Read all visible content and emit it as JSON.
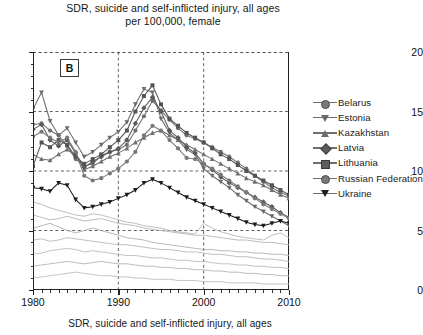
{
  "figure": {
    "title_line1": "SDR, suicide and self-inflicted injury, all ages",
    "title_line2": "per 100,000, female",
    "bottom_caption": "SDR, suicide and self-inflicted injury, all ages",
    "panel_label": "B"
  },
  "chart_data": {
    "type": "line",
    "title": "SDR, suicide and self-inflicted injury, all ages per 100,000, female",
    "xlabel": "",
    "ylabel": "",
    "xlim": [
      1980,
      2010
    ],
    "ylim": [
      0,
      20
    ],
    "yticks": [
      0,
      5,
      10,
      15,
      20
    ],
    "xticks": [
      1980,
      1990,
      2000,
      2010
    ],
    "xticks_minor_step": 1,
    "grid": true,
    "grid_style": "dashed",
    "legend_position": "right",
    "x": [
      1980,
      1981,
      1982,
      1983,
      1984,
      1985,
      1986,
      1987,
      1988,
      1989,
      1990,
      1991,
      1992,
      1993,
      1994,
      1995,
      1996,
      1997,
      1998,
      1999,
      2000,
      2001,
      2002,
      2003,
      2004,
      2005,
      2006,
      2007,
      2008,
      2009,
      2010
    ],
    "series": [
      {
        "name": "Belarus",
        "marker": "circle",
        "color": "#6f6f6f",
        "values": [
          13.9,
          14.0,
          13.4,
          13.0,
          12.1,
          11.0,
          10.4,
          10.6,
          11.3,
          11.6,
          11.8,
          12.2,
          13.4,
          14.6,
          15.9,
          15.1,
          14.3,
          13.6,
          13.0,
          12.7,
          12.4,
          12.0,
          11.6,
          11.2,
          10.7,
          10.2,
          9.6,
          9.1,
          8.6,
          8.2,
          7.9
        ]
      },
      {
        "name": "Estonia",
        "marker": "triangle-down",
        "color": "#6b6b6b",
        "values": [
          15.2,
          16.6,
          14.2,
          13.0,
          13.6,
          12.4,
          11.2,
          11.6,
          12.2,
          12.8,
          13.3,
          14.1,
          15.6,
          16.9,
          16.6,
          14.4,
          13.2,
          12.6,
          11.8,
          11.4,
          10.2,
          9.6,
          9.1,
          8.6,
          8.0,
          7.5,
          7.0,
          6.6,
          6.2,
          5.8,
          5.4
        ]
      },
      {
        "name": "Kazakhstan",
        "marker": "triangle-up",
        "color": "#707070",
        "values": [
          11.4,
          11.0,
          10.9,
          11.4,
          11.8,
          11.3,
          10.1,
          10.4,
          10.8,
          11.2,
          11.5,
          11.9,
          12.4,
          12.8,
          13.2,
          13.4,
          13.0,
          12.6,
          12.2,
          11.8,
          11.4,
          11.0,
          10.6,
          10.2,
          9.8,
          9.4,
          9.1,
          8.8,
          8.4,
          8.0,
          7.7
        ]
      },
      {
        "name": "Latvia",
        "marker": "diamond",
        "color": "#5a5a5a",
        "values": [
          13.5,
          13.9,
          12.6,
          12.1,
          12.6,
          11.5,
          10.3,
          10.8,
          11.2,
          11.6,
          11.9,
          12.6,
          14.0,
          15.3,
          16.2,
          15.0,
          13.4,
          12.8,
          12.0,
          11.5,
          10.6,
          10.1,
          9.5,
          9.0,
          8.6,
          8.2,
          7.8,
          7.4,
          7.0,
          6.5,
          6.1
        ]
      },
      {
        "name": "Lithuania",
        "marker": "square",
        "color": "#545454",
        "values": [
          10.4,
          12.4,
          12.0,
          12.6,
          12.2,
          11.2,
          10.6,
          11.0,
          11.4,
          12.0,
          12.6,
          13.4,
          15.0,
          16.3,
          17.2,
          15.6,
          14.4,
          13.8,
          13.2,
          12.8,
          12.4,
          11.9,
          11.4,
          11.0,
          10.5,
          10.0,
          9.6,
          9.2,
          8.8,
          8.4,
          8.0
        ]
      },
      {
        "name": "Russian Federation",
        "marker": "circle",
        "color": "#777777",
        "values": [
          12.9,
          13.3,
          12.8,
          12.4,
          12.8,
          11.6,
          9.6,
          9.2,
          9.4,
          9.8,
          10.2,
          10.8,
          11.6,
          13.0,
          13.8,
          13.4,
          12.6,
          11.9,
          11.1,
          11.0,
          10.6,
          10.2,
          9.7,
          9.2,
          8.7,
          8.2,
          7.7,
          7.2,
          6.8,
          6.4,
          6.0
        ]
      },
      {
        "name": "Ukraine",
        "marker": "triangle-down-filled",
        "color": "#1d1d1d",
        "values": [
          8.6,
          8.5,
          8.3,
          9.0,
          8.8,
          7.6,
          6.9,
          7.0,
          7.2,
          7.4,
          7.7,
          8.0,
          8.4,
          9.0,
          9.3,
          9.0,
          8.6,
          8.2,
          7.8,
          7.5,
          7.2,
          6.9,
          6.6,
          6.3,
          6.0,
          5.7,
          5.5,
          5.4,
          5.6,
          5.8,
          5.6
        ]
      }
    ],
    "background_series": [
      {
        "name": "reference-1",
        "color": "#b6b6b6",
        "values": [
          6.3,
          6.1,
          5.9,
          6.0,
          6.2,
          6.0,
          5.8,
          5.9,
          6.0,
          5.8,
          5.6,
          5.5,
          5.4,
          5.2,
          5.1,
          5.0,
          4.9,
          4.8,
          4.7,
          4.6,
          4.6,
          4.5,
          4.4,
          4.3,
          4.2,
          4.2,
          4.1,
          4.0,
          4.0,
          3.9,
          3.8
        ]
      },
      {
        "name": "reference-2",
        "color": "#b9b9b9",
        "values": [
          4.2,
          4.3,
          4.1,
          4.2,
          4.4,
          4.3,
          4.2,
          4.1,
          4.0,
          3.9,
          3.8,
          3.8,
          3.7,
          3.6,
          3.5,
          3.4,
          3.4,
          3.3,
          3.2,
          3.2,
          3.1,
          3.0,
          3.0,
          2.9,
          2.8,
          2.8,
          2.7,
          2.6,
          2.6,
          2.5,
          2.4
        ]
      },
      {
        "name": "reference-3",
        "color": "#bcbcbc",
        "values": [
          3.0,
          3.1,
          3.3,
          3.4,
          3.5,
          3.4,
          3.2,
          3.3,
          3.2,
          3.1,
          3.0,
          2.9,
          2.9,
          2.8,
          2.7,
          2.7,
          2.6,
          2.5,
          2.5,
          2.4,
          2.4,
          2.3,
          2.2,
          2.2,
          2.1,
          2.1,
          2.0,
          2.0,
          1.9,
          1.9,
          1.8
        ]
      },
      {
        "name": "reference-4",
        "color": "#b4b4b4",
        "values": [
          2.0,
          2.1,
          2.2,
          2.3,
          2.4,
          2.3,
          2.2,
          2.3,
          2.4,
          2.3,
          2.2,
          2.2,
          2.1,
          2.0,
          2.0,
          1.9,
          1.9,
          1.8,
          1.8,
          1.7,
          1.7,
          1.6,
          1.6,
          1.5,
          1.5,
          1.4,
          1.4,
          1.3,
          1.3,
          1.2,
          1.2
        ]
      },
      {
        "name": "reference-5",
        "color": "#bdbdbd",
        "values": [
          1.0,
          1.1,
          1.2,
          1.3,
          1.4,
          1.5,
          1.4,
          1.3,
          1.2,
          1.2,
          1.1,
          1.1,
          1.0,
          1.0,
          0.9,
          0.9,
          0.9,
          0.8,
          0.8,
          0.8,
          0.7,
          0.7,
          0.7,
          0.6,
          0.6,
          0.6,
          0.6,
          0.5,
          0.5,
          0.5,
          0.5
        ]
      },
      {
        "name": "reference-6",
        "color": "#b0b0b0",
        "values": [
          5.2,
          5.4,
          5.6,
          5.3,
          5.0,
          4.8,
          5.0,
          5.2,
          5.0,
          4.8,
          4.6,
          4.4,
          4.3,
          4.2,
          4.0,
          3.9,
          3.8,
          3.7,
          3.6,
          3.5,
          3.4,
          3.4,
          3.3,
          3.3,
          3.2,
          3.2,
          3.1,
          3.1,
          3.0,
          3.0,
          2.9
        ]
      },
      {
        "name": "reference-7",
        "color": "#b7b7b7",
        "values": [
          7.4,
          7.2,
          6.9,
          6.7,
          6.5,
          6.3,
          6.2,
          6.4,
          6.3,
          6.1,
          5.9,
          5.7,
          5.6,
          5.4,
          5.3,
          5.2,
          5.0,
          4.9,
          4.8,
          4.7,
          5.6,
          5.2,
          4.9,
          4.7,
          4.5,
          4.4,
          4.3,
          4.2,
          4.6,
          4.8,
          4.4
        ]
      }
    ]
  },
  "axes": {
    "y_labels": [
      "20",
      "15",
      "10",
      "5",
      "0"
    ],
    "x_labels": [
      "1980",
      "1990",
      "2000",
      "2010"
    ]
  },
  "legend": {
    "items": [
      {
        "label": "Belarus",
        "marker": "circle"
      },
      {
        "label": "Estonia",
        "marker": "triangle-down"
      },
      {
        "label": "Kazakhstan",
        "marker": "triangle-up"
      },
      {
        "label": "Latvia",
        "marker": "diamond"
      },
      {
        "label": "Lithuania",
        "marker": "square"
      },
      {
        "label": "Russian Federation",
        "marker": "circle"
      },
      {
        "label": "Ukraine",
        "marker": "triangle-down-filled"
      }
    ]
  }
}
